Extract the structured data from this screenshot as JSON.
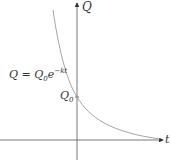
{
  "diagram": {
    "type": "exponential-decay-graph",
    "y_axis_label": "Q",
    "x_axis_label": "t",
    "intercept_label": "Q",
    "intercept_subscript": "0",
    "equation": {
      "lhs": "Q",
      "eq": "=",
      "base": "Q",
      "base_sub": "0",
      "e": "e",
      "exponent": "−kt"
    },
    "colors": {
      "axis": "#555555",
      "curve": "#999999",
      "text": "#333333"
    }
  }
}
